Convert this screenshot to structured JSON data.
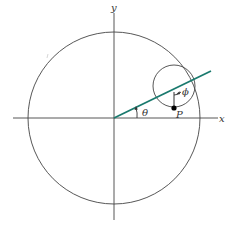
{
  "diagram": {
    "type": "geometry",
    "labels": {
      "x_axis": "x",
      "y_axis": "y",
      "angle_theta": "θ",
      "angle_phi": "ϕ",
      "point": "P"
    },
    "colors": {
      "line": "#1a7a6e",
      "stroke": "#444444",
      "point": "#000000"
    },
    "elements": {
      "large_circle": {
        "cx": 114,
        "cy": 118,
        "r": 86
      },
      "small_circle": {
        "cx": 174,
        "cy": 86,
        "r": 21
      },
      "x_axis": {
        "x1": 13,
        "y1": 118,
        "x2": 218,
        "y2": 118
      },
      "y_axis": {
        "x1": 114,
        "y1": 13,
        "x2": 114,
        "y2": 220
      },
      "radial_line": {
        "x1": 114,
        "y1": 118,
        "x2": 211,
        "y2": 71
      },
      "point_P": {
        "cx": 174,
        "cy": 108,
        "r": 2.6
      }
    }
  }
}
